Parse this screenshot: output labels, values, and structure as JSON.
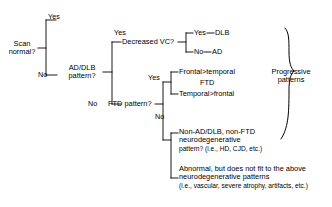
{
  "diagram": {
    "type": "decision-tree",
    "line_color": "#000000",
    "background": "#ffffff",
    "nodes": {
      "root": "Scan\nnormal?",
      "root_line1": "Scan",
      "root_line2": "normal?",
      "ad_dlb_line1": "AD/DLB",
      "ad_dlb_line2": "pattern?",
      "decreased_vc": "Decreased VC?",
      "ftd_pattern": "FTD pattern?"
    },
    "edges": {
      "root_yes": "Yes",
      "root_no": "No",
      "ad_dlb_yes": "Yes",
      "ad_dlb_no": "No",
      "vc_yes": "Yes",
      "vc_no": "No",
      "ftd_yes": "Yes",
      "ftd_no": "No"
    },
    "terminals": {
      "dlb": "DLB",
      "ad": "AD",
      "frontal_temporal": "Frontal>temporal",
      "ftd": "FTD",
      "temporal_frontal": "Temporal>frontal",
      "non_ad_dlb_line1": "Non-AD/DLB, non-FTD",
      "non_ad_dlb_line2": "neurodegenerative",
      "non_ad_dlb_line3": "pattern? (i.e., HD, CJD, etc.)",
      "abnormal_line1": "Abnormal, but does not fit to the above",
      "abnormal_line2": "neurodegenerative patterns",
      "abnormal_line3": "(i.e., vascular, severe atrophy, artifacts, etc.)"
    },
    "groups": {
      "progressive_line1": "Progressive",
      "progressive_line2": "patterns"
    }
  }
}
